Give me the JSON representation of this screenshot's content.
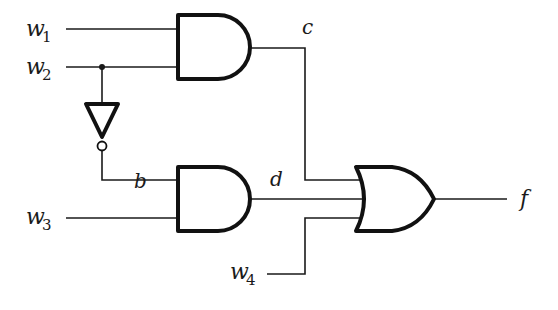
{
  "diagram": {
    "type": "logic-circuit",
    "inputs": [
      {
        "name": "w",
        "subscript": "1"
      },
      {
        "name": "w",
        "subscript": "2"
      },
      {
        "name": "w",
        "subscript": "3"
      },
      {
        "name": "w",
        "subscript": "4"
      }
    ],
    "signals": {
      "b": "b",
      "c": "c",
      "d": "d",
      "f": "f"
    },
    "gates": [
      {
        "id": "and1",
        "type": "AND",
        "inputs": [
          "w1",
          "w2"
        ],
        "output": "c"
      },
      {
        "id": "not1",
        "type": "NOT",
        "inputs": [
          "w2"
        ],
        "output": "b"
      },
      {
        "id": "and2",
        "type": "AND",
        "inputs": [
          "b",
          "w3"
        ],
        "output": "d"
      },
      {
        "id": "or1",
        "type": "OR",
        "inputs": [
          "c",
          "d",
          "w4"
        ],
        "output": "f"
      }
    ],
    "colors": {
      "line": "#1a1a1a",
      "background": "#ffffff"
    }
  }
}
